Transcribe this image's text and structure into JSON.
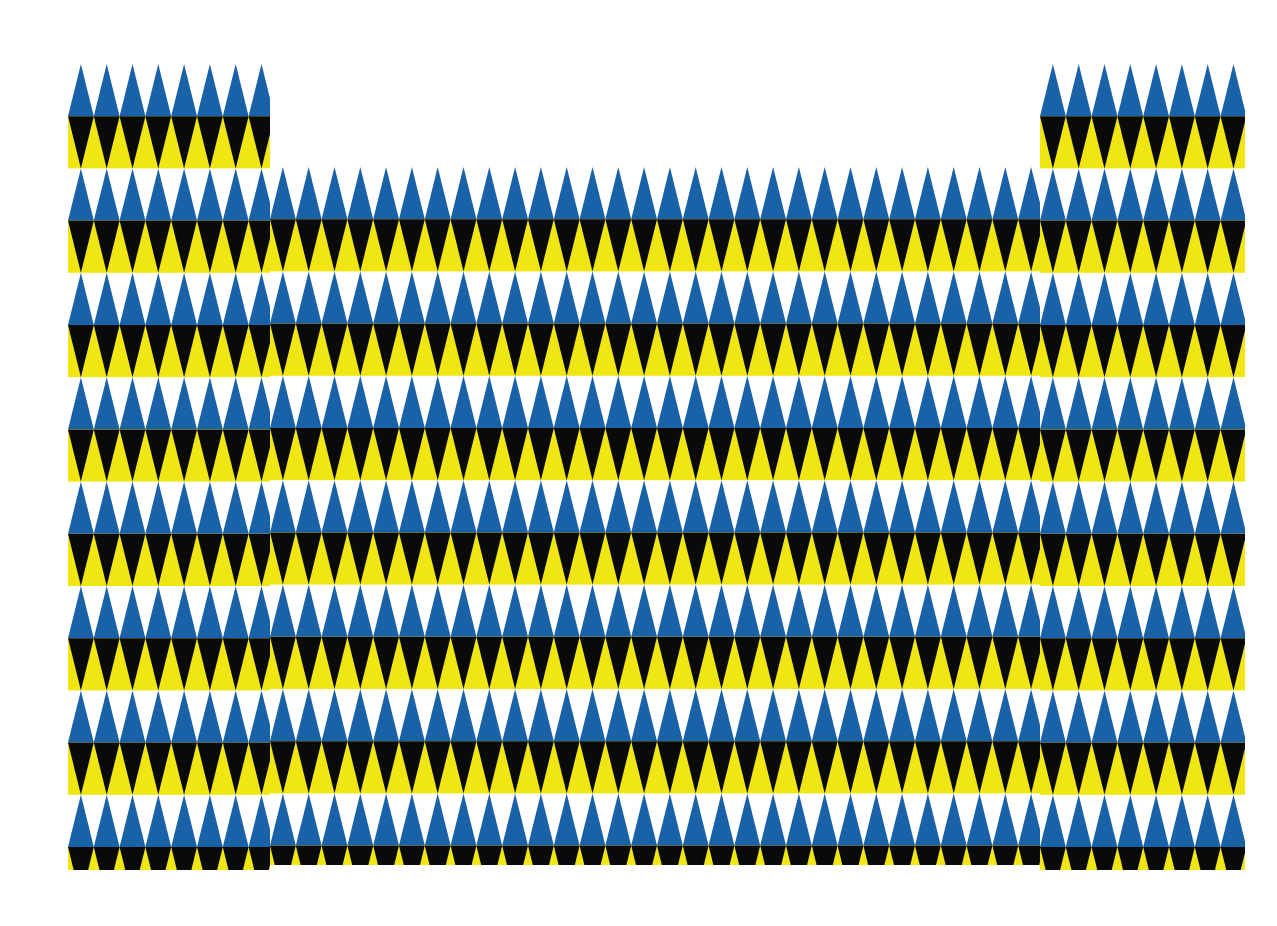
{
  "artwork": {
    "title": "Triangle Pattern Composition",
    "canvas_width": 1277,
    "canvas_height": 926,
    "background_color": "#FFFFFF"
  },
  "palette": {
    "blue": "#1A62A8",
    "yellow": "#F0E614",
    "black": "#0A0A0A",
    "white": "#FFFFFF"
  },
  "geometry": {
    "triangle_width": 25.8,
    "row_height": 52.2,
    "band_height": 104.4,
    "description": "Each band consists of an upward-pointing triangle row over a downward-pointing triangle row."
  },
  "blocks": [
    {
      "name": "left-column-block",
      "x": 68,
      "y": 64,
      "width": 202,
      "height": 806,
      "phase_y": 0,
      "columns": 8,
      "bands": 7.7
    },
    {
      "name": "center-field-block",
      "x": 270,
      "y": 167,
      "width": 770,
      "height": 698,
      "phase_y": 0,
      "columns": 30,
      "bands": 6.7
    },
    {
      "name": "right-column-block",
      "x": 1040,
      "y": 64,
      "width": 205,
      "height": 806,
      "phase_y": 0,
      "columns": 8,
      "bands": 7.7
    }
  ],
  "band_sequence": [
    {
      "up_row_color": "blue",
      "up_row_ground": "white",
      "down_row_color": "black",
      "down_row_ground": "yellow"
    },
    {
      "up_row_color": "blue",
      "up_row_ground": "white",
      "down_row_color": "black",
      "down_row_ground": "yellow"
    }
  ],
  "chart_data": {
    "type": "heatmap",
    "xlabel": "",
    "ylabel": "",
    "categories": [
      "left-column-block",
      "center-field-block",
      "right-column-block"
    ],
    "series": [
      {
        "name": "block-x-start",
        "values": [
          68,
          270,
          1040
        ]
      },
      {
        "name": "block-y-start",
        "values": [
          64,
          167,
          64
        ]
      },
      {
        "name": "block-width",
        "values": [
          202,
          770,
          205
        ]
      },
      {
        "name": "block-height",
        "values": [
          806,
          698,
          806
        ]
      },
      {
        "name": "triangle-columns",
        "values": [
          8,
          30,
          8
        ]
      }
    ],
    "legend": [
      "blue",
      "yellow",
      "black",
      "white"
    ],
    "grid": false
  }
}
